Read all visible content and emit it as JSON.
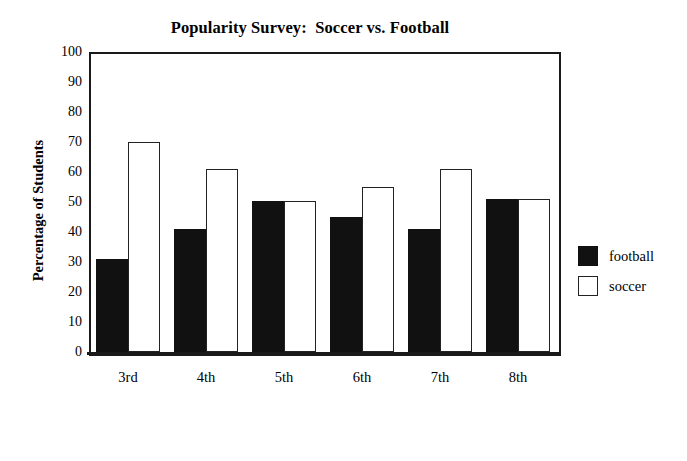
{
  "chart_data": {
    "type": "bar",
    "title": "Popularity Survey:  Soccer vs. Football",
    "xlabel": "Grade Level",
    "ylabel": "Percentage of Students",
    "categories": [
      "3rd",
      "4th",
      "5th",
      "6th",
      "7th",
      "8th"
    ],
    "series": [
      {
        "name": "football",
        "color": "#111111",
        "values": [
          31,
          41,
          50.5,
          45,
          41,
          51
        ]
      },
      {
        "name": "soccer",
        "color": "#ffffff",
        "values": [
          70,
          61,
          50.5,
          55,
          61,
          51
        ]
      }
    ],
    "ylim": [
      0,
      100
    ],
    "ytick_values": [
      100,
      90,
      80,
      70,
      60,
      50,
      40,
      30,
      20,
      10,
      0
    ],
    "ytick_labels": [
      "100",
      "90",
      "80",
      "70",
      "60",
      "50",
      "40",
      "30",
      "20",
      "10",
      "0"
    ],
    "grid": false,
    "legend_position": "right",
    "legend_entries": [
      "football",
      "soccer"
    ]
  }
}
